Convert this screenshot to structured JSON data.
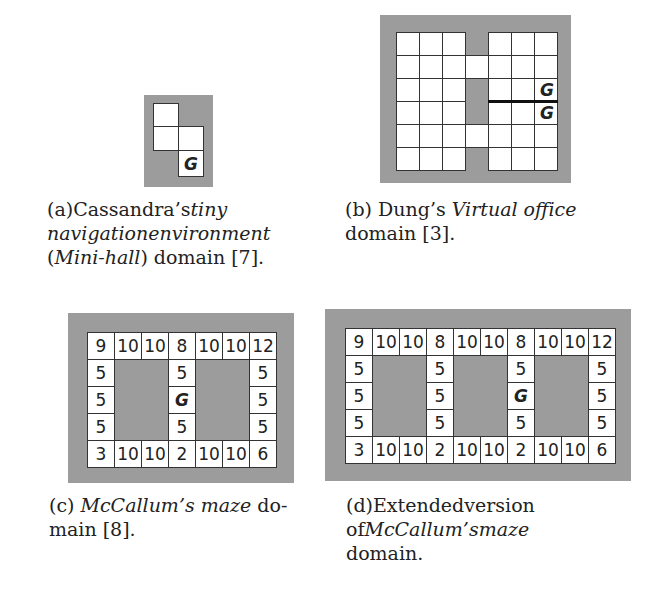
{
  "figures": [
    {
      "id": "a",
      "caption_lines": [
        [
          {
            "t": "(a)",
            "i": false
          },
          {
            "t": "Cassandra’s",
            "i": false
          },
          {
            "t": "tiny",
            "i": true
          }
        ],
        [
          {
            "t": "navigation",
            "i": true
          },
          {
            "t": "environment",
            "i": true
          }
        ],
        [
          {
            "t": "(",
            "i": false
          },
          {
            "t": "Mini-hall",
            "i": true
          },
          {
            "t": ") domain [7].",
            "i": false
          }
        ]
      ],
      "grid": {
        "frame": {
          "x": 144,
          "y": 95,
          "w": 69,
          "h": 92
        },
        "cells": [
          {
            "x": 153,
            "y": 103,
            "w": 26,
            "h": 24,
            "label": ""
          },
          {
            "x": 153,
            "y": 126,
            "w": 26,
            "h": 25,
            "label": ""
          },
          {
            "x": 178,
            "y": 126,
            "w": 26,
            "h": 25,
            "label": ""
          },
          {
            "x": 178,
            "y": 150,
            "w": 26,
            "h": 27,
            "label": "G",
            "goal": true
          }
        ]
      }
    },
    {
      "id": "b",
      "caption_lines": [
        [
          {
            "t": "(b) Dung’s ",
            "i": false
          },
          {
            "t": "Virtual office",
            "i": true
          }
        ],
        [
          {
            "t": "domain [3].",
            "i": false
          }
        ]
      ],
      "grid": {
        "frame": {
          "x": 380,
          "y": 15,
          "w": 191,
          "h": 168
        },
        "rows": 6,
        "cell_h": 23,
        "origin_y": 32,
        "left_cols_x": [
          396,
          419,
          442
        ],
        "corridor_x": 465,
        "right_cols_x": [
          488,
          511,
          534
        ],
        "cell_w": 23,
        "corridor_open_rows": [
          1,
          4
        ],
        "goals": [
          {
            "col": 2,
            "row": 2,
            "label": "G"
          },
          {
            "col": 2,
            "row": 3,
            "label": "G"
          }
        ],
        "wall": {
          "from_col": 0,
          "to_col": 2,
          "between_rows": [
            2,
            3
          ]
        }
      }
    },
    {
      "id": "c",
      "caption_lines": [
        [
          {
            "t": "(c) ",
            "i": false
          },
          {
            "t": "McCallum’s maze",
            "i": true
          },
          {
            "t": " do-",
            "i": false
          }
        ],
        [
          {
            "t": "main [8].",
            "i": false
          }
        ]
      ],
      "grid": {
        "frame": {
          "x": 68,
          "y": 313,
          "w": 226,
          "h": 170
        },
        "origin_x": 87,
        "origin_y": 332,
        "cell_w": 27,
        "cell_h": 27,
        "rows": [
          [
            "9",
            "10",
            "10",
            "8",
            "10",
            "10",
            "12"
          ],
          [
            "5",
            null,
            null,
            "5",
            null,
            null,
            "5"
          ],
          [
            "5",
            null,
            null,
            "G",
            null,
            null,
            "5"
          ],
          [
            "5",
            null,
            null,
            "5",
            null,
            null,
            "5"
          ],
          [
            "3",
            "10",
            "10",
            "2",
            "10",
            "10",
            "6"
          ]
        ]
      }
    },
    {
      "id": "d",
      "caption_lines": [
        [
          {
            "t": "(d)",
            "i": false
          },
          {
            "t": "Extended",
            "i": false
          },
          {
            "t": "version",
            "i": false
          }
        ],
        [
          {
            "t": "of",
            "i": false
          },
          {
            "t": "McCallum’s",
            "i": true
          },
          {
            "t": "maze",
            "i": true
          }
        ],
        [
          {
            "t": "domain.",
            "i": false
          }
        ]
      ],
      "grid": {
        "frame": {
          "x": 325,
          "y": 309,
          "w": 306,
          "h": 172
        },
        "origin_x": 345,
        "origin_y": 328,
        "cell_w": 27,
        "cell_h": 27,
        "rows": [
          [
            "9",
            "10",
            "10",
            "8",
            "10",
            "10",
            "8",
            "10",
            "10",
            "12"
          ],
          [
            "5",
            null,
            null,
            "5",
            null,
            null,
            "5",
            null,
            null,
            "5"
          ],
          [
            "5",
            null,
            null,
            "5",
            null,
            null,
            "G",
            null,
            null,
            "5"
          ],
          [
            "5",
            null,
            null,
            "5",
            null,
            null,
            "5",
            null,
            null,
            "5"
          ],
          [
            "3",
            "10",
            "10",
            "2",
            "10",
            "10",
            "2",
            "10",
            "10",
            "6"
          ]
        ]
      }
    }
  ],
  "colors": {
    "wall_gray": "#9c9c9c",
    "cell_white": "#ffffff",
    "line": "#333333"
  }
}
